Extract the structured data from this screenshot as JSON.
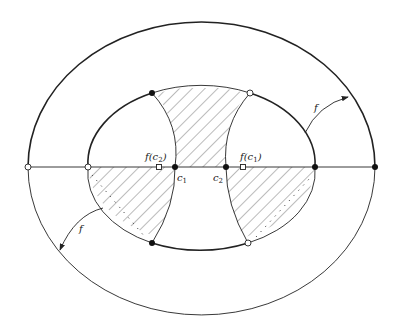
{
  "figure": {
    "labels": {
      "f_top": "f",
      "f_bottom": "f",
      "fc2": "f(c",
      "fc2_sub": "2",
      "fc1": "f(c",
      "fc1_sub": "1",
      "c1": "c",
      "c1_sub": "1",
      "c2": "c",
      "c2_sub": "2",
      "close_paren": ")"
    },
    "colors": {
      "stroke": "#222222",
      "hatch": "#555555",
      "background": "#ffffff"
    }
  }
}
